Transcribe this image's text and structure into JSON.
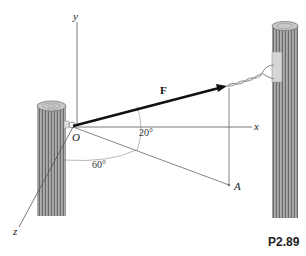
{
  "figure": {
    "caption": "P2.89",
    "labels": {
      "origin": "O",
      "x_axis": "x",
      "y_axis": "y",
      "z_axis": "z",
      "force": "F",
      "point_a": "A"
    },
    "angles": {
      "elevation": "20°",
      "azimuth": "60°"
    },
    "colors": {
      "axis": "#555555",
      "force": "#111111",
      "wood_dark": "#6e6e6e",
      "wood_light": "#b8b8b8",
      "bracket": "#d0d0d0"
    }
  }
}
